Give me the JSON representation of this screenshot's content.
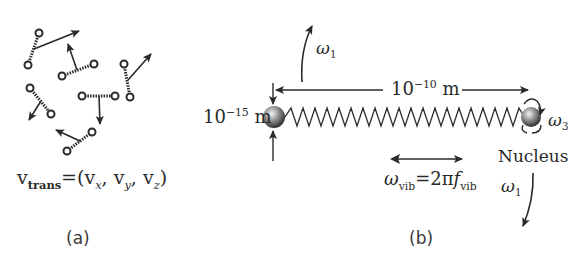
{
  "panel_a": {
    "caption": "(a)",
    "equation": {
      "lhs": "v",
      "lhs_sub": "trans",
      "eq": "=(",
      "vx": "v",
      "x": "x",
      "sep1": ", ",
      "vy": "v",
      "y": "y",
      "sep2": ", ",
      "vz": "v",
      "z": "z",
      "close": ")"
    },
    "molecule_count": 6
  },
  "panel_b": {
    "caption": "(b)",
    "omega1_top": {
      "sym": "ω",
      "sub": "1"
    },
    "omega1_bottom": {
      "sym": "ω",
      "sub": "1"
    },
    "omega3": {
      "sym": "ω",
      "sub": "3"
    },
    "length_label": {
      "base": "10",
      "exp": "−10",
      "unit": " m"
    },
    "nucleus_size_label": {
      "base": "10",
      "exp": "−15",
      "unit": " m"
    },
    "nucleus_label": "Nucleus",
    "vib_eq": {
      "sym": "ω",
      "sub": "vib",
      "mid": "=2π",
      "f": "f",
      "fsub": "vib"
    }
  }
}
